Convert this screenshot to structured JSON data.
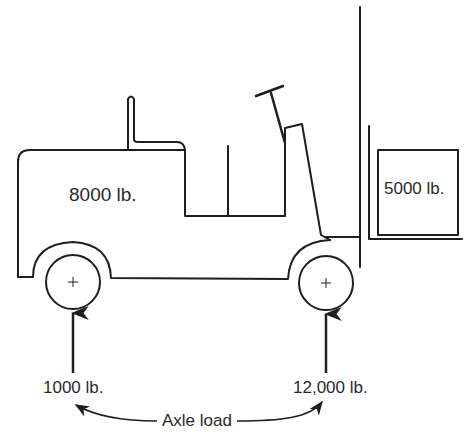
{
  "diagram": {
    "stroke_color": "#1e1e1e",
    "labels": {
      "truck_weight": "8000 lb.",
      "load_weight": "5000 lb.",
      "rear_axle_load": "1000 lb.",
      "front_axle_load": "12,000 lb.",
      "axle_load_caption": "Axle load"
    },
    "components": {
      "body": "truck-body",
      "seat": "operator-seat",
      "steering": "steering-wheel",
      "mast": "lift-mast",
      "fork": "fork",
      "load": "load-box",
      "rear_wheel": "rear-wheel",
      "front_wheel": "front-wheel"
    }
  }
}
